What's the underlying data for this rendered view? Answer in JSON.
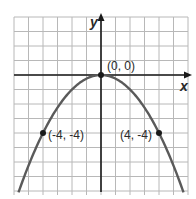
{
  "chart_data": {
    "type": "line",
    "title": "",
    "function": "y = -x^2 / 4",
    "xlabel": "x",
    "ylabel": "y",
    "xlim": [
      -6,
      6
    ],
    "ylim": [
      -8,
      4
    ],
    "grid": true,
    "points": [
      {
        "x": 0,
        "y": 0,
        "label": "(0, 0)"
      },
      {
        "x": -4,
        "y": -4,
        "label": "(-4, -4)"
      },
      {
        "x": 4,
        "y": -4,
        "label": "(4, -4)"
      }
    ],
    "colors": {
      "curve": "#5a5a5a",
      "grid": "#b8b8b8",
      "axis": "#1a1a1a",
      "point": "#1a1a1a"
    }
  },
  "labels": {
    "x_axis": "x",
    "y_axis": "y",
    "vertex": "(0, 0)",
    "left_point": "(-4, -4)",
    "right_point": "(4, -4)"
  }
}
